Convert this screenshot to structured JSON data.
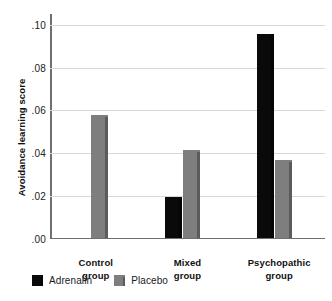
{
  "chart_data": {
    "type": "bar",
    "title": "",
    "xlabel": "",
    "ylabel": "Avoidance learning score",
    "categories": [
      "Control group",
      "Mixed group",
      "Psychopathic group"
    ],
    "category_lines": [
      [
        "Control",
        "group"
      ],
      [
        "Mixed",
        "group"
      ],
      [
        "Psychopathic",
        "group"
      ]
    ],
    "series": [
      {
        "name": "Adrenalin",
        "color": "#0a0a0a",
        "values": [
          null,
          0.019,
          0.095
        ]
      },
      {
        "name": "Placebo",
        "color": "#7e7e7e",
        "values": [
          0.057,
          0.041,
          0.036
        ]
      }
    ],
    "ylim": [
      0.0,
      0.105
    ],
    "yticks": [
      0.0,
      0.02,
      0.04,
      0.06,
      0.08,
      0.1
    ],
    "ytick_labels": [
      ".00",
      ".02",
      ".04",
      ".06",
      ".08",
      ".10"
    ],
    "grid": "horizontal",
    "legend_position": "below-left"
  },
  "legend": {
    "items": [
      {
        "label": "Adrenalin",
        "swatch": "dark"
      },
      {
        "label": "Placebo",
        "swatch": "light"
      }
    ]
  }
}
